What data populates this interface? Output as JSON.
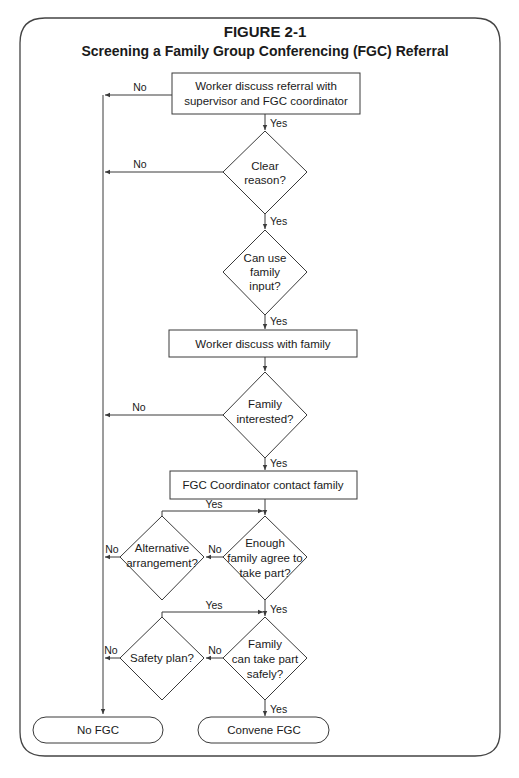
{
  "figure": {
    "label": "FIGURE 2-1",
    "title": "Screening a Family Group Conferencing (FGC) Referral"
  },
  "nodes": {
    "worker_discuss_referral": [
      "Worker discuss referral with",
      "supervisor and FGC coordinator"
    ],
    "clear_reason": [
      "Clear",
      "reason?"
    ],
    "can_use_family_input": [
      "Can use",
      "family",
      "input?"
    ],
    "worker_discuss_family": [
      "Worker discuss with family"
    ],
    "family_interested": [
      "Family",
      "interested?"
    ],
    "coordinator_contact": [
      "FGC Coordinator contact family"
    ],
    "enough_family_agree": [
      "Enough",
      "family agree to",
      "take part?"
    ],
    "alternative_arrangement": [
      "Alternative",
      "arrangement?"
    ],
    "family_take_part_safely": [
      "Family",
      "can take part",
      "safely?"
    ],
    "safety_plan": [
      "Safety plan?"
    ],
    "no_fgc": [
      "No FGC"
    ],
    "convene_fgc": [
      "Convene FGC"
    ]
  },
  "edge_labels": {
    "yes": "Yes",
    "no": "No"
  },
  "edges": [
    {
      "from": "worker_discuss_referral",
      "to": "clear_reason",
      "label": "Yes"
    },
    {
      "from": "worker_discuss_referral",
      "to": "no_fgc",
      "label": "No"
    },
    {
      "from": "clear_reason",
      "to": "can_use_family_input",
      "label": "Yes"
    },
    {
      "from": "clear_reason",
      "to": "no_fgc",
      "label": "No"
    },
    {
      "from": "can_use_family_input",
      "to": "worker_discuss_family",
      "label": "Yes"
    },
    {
      "from": "worker_discuss_family",
      "to": "family_interested",
      "label": ""
    },
    {
      "from": "family_interested",
      "to": "coordinator_contact",
      "label": "Yes"
    },
    {
      "from": "family_interested",
      "to": "no_fgc",
      "label": "No"
    },
    {
      "from": "coordinator_contact",
      "to": "enough_family_agree",
      "label": ""
    },
    {
      "from": "enough_family_agree",
      "to": "alternative_arrangement",
      "label": "No"
    },
    {
      "from": "alternative_arrangement",
      "to": "enough_family_agree",
      "label": "Yes"
    },
    {
      "from": "alternative_arrangement",
      "to": "no_fgc",
      "label": "No"
    },
    {
      "from": "enough_family_agree",
      "to": "family_take_part_safely",
      "label": "Yes"
    },
    {
      "from": "family_take_part_safely",
      "to": "safety_plan",
      "label": "No"
    },
    {
      "from": "safety_plan",
      "to": "family_take_part_safely",
      "label": "Yes"
    },
    {
      "from": "safety_plan",
      "to": "no_fgc",
      "label": "No"
    },
    {
      "from": "family_take_part_safely",
      "to": "convene_fgc",
      "label": "Yes"
    }
  ],
  "colors": {
    "stroke": "#3a3a3a",
    "text": "#1a1a1a",
    "background": "#ffffff"
  }
}
